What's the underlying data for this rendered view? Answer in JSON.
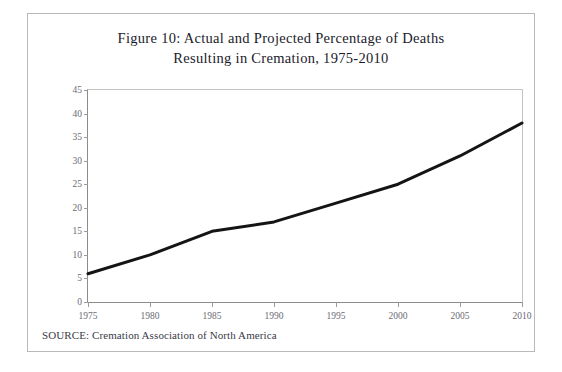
{
  "figure": {
    "title": "Figure 10: Actual and Projected Percentage of Deaths\nResulting in Cremation, 1975-2010",
    "source_note": "SOURCE: Cremation Association of North America"
  },
  "chart_data": {
    "type": "line",
    "title": "Figure 10: Actual and Projected Percentage of Deaths Resulting in Cremation, 1975-2010",
    "xlabel": "",
    "ylabel": "",
    "x": [
      1975,
      1980,
      1985,
      1990,
      1995,
      2000,
      2005,
      2010
    ],
    "categories": [
      "1975",
      "1980",
      "1985",
      "1990",
      "1995",
      "2000",
      "2005",
      "2010"
    ],
    "values": [
      6,
      10,
      15,
      17,
      21,
      25,
      31,
      38
    ],
    "series": [
      {
        "name": "Percentage of deaths resulting in cremation",
        "values": [
          6,
          10,
          15,
          17,
          21,
          25,
          31,
          38
        ]
      }
    ],
    "xlim": [
      1975,
      2010
    ],
    "ylim": [
      0,
      45
    ],
    "y_ticks": [
      0,
      5,
      10,
      15,
      20,
      25,
      30,
      35,
      40,
      45
    ],
    "y_tick_labels": [
      "0",
      "5",
      "10",
      "15",
      "20",
      "25",
      "30",
      "35",
      "40",
      "45"
    ],
    "x_ticks": [
      1975,
      1980,
      1985,
      1990,
      1995,
      2000,
      2005,
      2010
    ],
    "x_tick_labels": [
      "1975",
      "1980",
      "1985",
      "1990",
      "1995",
      "2000",
      "2005",
      "2010"
    ],
    "grid": false,
    "legend": false,
    "line_color": "#141414",
    "line_width": 3,
    "background_color": "#ffffff"
  }
}
